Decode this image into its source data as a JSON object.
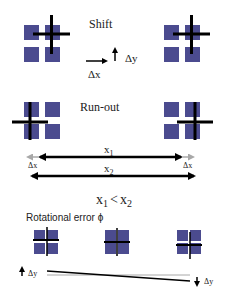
{
  "colors": {
    "square": "#4b4b8f",
    "square_border": "#3a3a78",
    "line": "#000000",
    "gray_arrow": "#a8a8a8",
    "background": "#ffffff"
  },
  "sections": {
    "shift": {
      "title": "Shift",
      "dx_label": "Δx",
      "dy_label": "Δy"
    },
    "runout": {
      "title": "Run-out",
      "x1_label": "x",
      "x1_sub": "1",
      "x2_label": "x",
      "x2_sub": "2",
      "dx_left": "Δx",
      "dx_right": "Δx",
      "relation": {
        "a": "x",
        "a_sub": "1",
        "op": "<",
        "b": "x",
        "b_sub": "2"
      }
    },
    "rotation": {
      "title": "Rotational error ϕ",
      "dy_left": "Δy",
      "dy_right": "Δy"
    }
  }
}
